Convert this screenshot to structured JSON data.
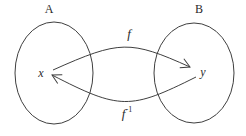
{
  "diagram": {
    "set_a_label": "A",
    "set_b_label": "B",
    "element_x": "x",
    "element_y": "y",
    "arrow_f_label": "f",
    "arrow_f_inverse_base": "f",
    "arrow_f_inverse_sup": "-1",
    "arrows": [
      {
        "name": "f",
        "from": "x",
        "to": "y",
        "shape": "upper-arc"
      },
      {
        "name": "f-inverse",
        "from": "y",
        "to": "x",
        "shape": "lower-arc"
      }
    ],
    "colors": {
      "line": "#3f3f3f",
      "text": "#2b2b2b",
      "background": "#ffffff"
    }
  }
}
